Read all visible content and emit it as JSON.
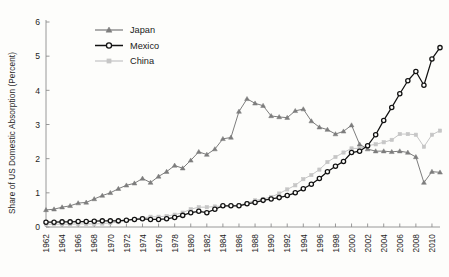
{
  "chart_data": {
    "type": "line",
    "title": "",
    "subtitle": "",
    "xlabel": "",
    "ylabel": "Share of US Domestic Absorption (Percent)",
    "xlim": [
      1962,
      2011
    ],
    "ylim": [
      0,
      6
    ],
    "y_ticks": [
      "0",
      "1",
      "2",
      "3",
      "4",
      "5",
      "6"
    ],
    "y_tick_values": [
      0,
      1,
      2,
      3,
      4,
      5,
      6
    ],
    "x_ticks": [
      "1962",
      "1964",
      "1966",
      "1968",
      "1970",
      "1972",
      "1974",
      "1976",
      "1978",
      "1980",
      "1982",
      "1984",
      "1986",
      "1988",
      "1990",
      "1992",
      "1994",
      "1996",
      "1998",
      "2000",
      "2002",
      "2004",
      "2006",
      "2008",
      "2010"
    ],
    "x_tick_values": [
      1962,
      1964,
      1966,
      1968,
      1970,
      1972,
      1974,
      1976,
      1978,
      1980,
      1982,
      1984,
      1986,
      1988,
      1990,
      1992,
      1994,
      1996,
      1998,
      2000,
      2002,
      2004,
      2006,
      2008,
      2010
    ],
    "grid": false,
    "legend_position": "top-left",
    "x": [
      1962,
      1963,
      1964,
      1965,
      1966,
      1967,
      1968,
      1969,
      1970,
      1971,
      1972,
      1973,
      1974,
      1975,
      1976,
      1977,
      1978,
      1979,
      1980,
      1981,
      1982,
      1983,
      1984,
      1985,
      1986,
      1987,
      1988,
      1989,
      1990,
      1991,
      1992,
      1993,
      1994,
      1995,
      1996,
      1997,
      1998,
      1999,
      2000,
      2001,
      2002,
      2003,
      2004,
      2005,
      2006,
      2007,
      2008,
      2009,
      2010,
      2011
    ],
    "series": [
      {
        "name": "Japan",
        "color": "#7d7d7d",
        "marker": "triangle",
        "values": [
          0.5,
          0.52,
          0.58,
          0.62,
          0.7,
          0.72,
          0.82,
          0.92,
          1.0,
          1.12,
          1.22,
          1.28,
          1.42,
          1.3,
          1.48,
          1.62,
          1.8,
          1.72,
          1.95,
          2.2,
          2.12,
          2.28,
          2.58,
          2.62,
          3.38,
          3.75,
          3.62,
          3.55,
          3.25,
          3.22,
          3.2,
          3.4,
          3.45,
          3.1,
          2.92,
          2.85,
          2.72,
          2.8,
          2.98,
          2.42,
          2.28,
          2.22,
          2.22,
          2.2,
          2.22,
          2.18,
          2.05,
          1.3,
          1.62,
          1.6
        ]
      },
      {
        "name": "Mexico",
        "color": "#121212",
        "marker": "circle",
        "values": [
          0.14,
          0.14,
          0.15,
          0.15,
          0.16,
          0.16,
          0.17,
          0.18,
          0.18,
          0.18,
          0.2,
          0.22,
          0.24,
          0.22,
          0.22,
          0.24,
          0.28,
          0.34,
          0.42,
          0.46,
          0.42,
          0.52,
          0.62,
          0.62,
          0.62,
          0.68,
          0.72,
          0.78,
          0.82,
          0.86,
          0.92,
          1.0,
          1.12,
          1.25,
          1.42,
          1.62,
          1.78,
          1.92,
          2.18,
          2.22,
          2.38,
          2.7,
          3.12,
          3.5,
          3.9,
          4.28,
          4.55,
          4.15,
          4.92,
          5.25
        ]
      },
      {
        "name": "China",
        "color": "#c6c6c6",
        "marker": "square",
        "values": [
          0.08,
          0.08,
          0.08,
          0.08,
          0.09,
          0.09,
          0.09,
          0.1,
          0.12,
          0.14,
          0.18,
          0.24,
          0.26,
          0.3,
          0.3,
          0.32,
          0.36,
          0.42,
          0.52,
          0.58,
          0.58,
          0.6,
          0.62,
          0.62,
          0.64,
          0.7,
          0.78,
          0.82,
          0.88,
          0.98,
          1.1,
          1.22,
          1.4,
          1.52,
          1.68,
          1.9,
          2.05,
          2.18,
          2.3,
          2.3,
          2.38,
          2.42,
          2.48,
          2.55,
          2.72,
          2.72,
          2.7,
          2.35,
          2.7,
          2.82
        ]
      }
    ]
  },
  "legend": {
    "items": [
      {
        "label": "Japan"
      },
      {
        "label": "Mexico"
      },
      {
        "label": "China"
      }
    ]
  }
}
